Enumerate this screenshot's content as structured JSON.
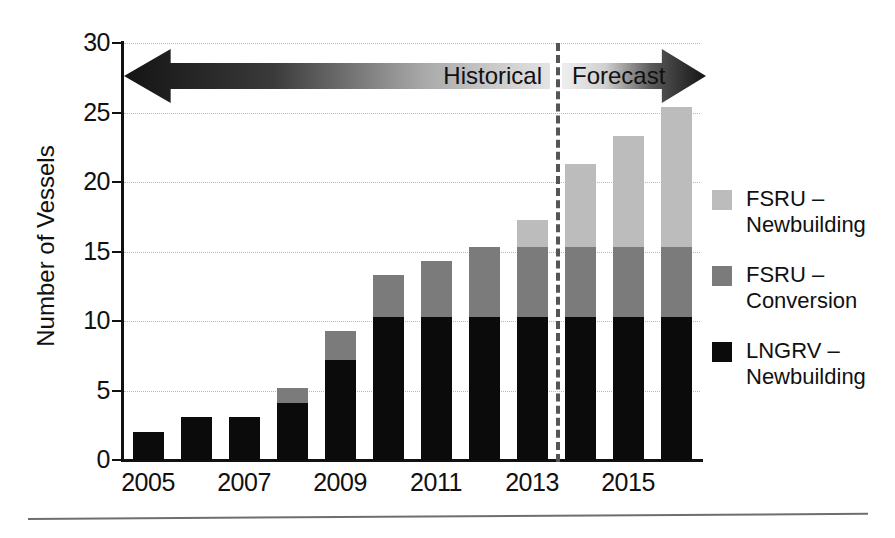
{
  "chart_data": {
    "type": "bar",
    "subtype": "stacked-vertical",
    "title": "",
    "xlabel": "",
    "ylabel": "Number of Vessels",
    "ylim": [
      0,
      30
    ],
    "yticks": [
      0,
      5,
      10,
      15,
      20,
      25,
      30
    ],
    "ytick_labels": [
      "0",
      "5",
      "10",
      "15",
      "20",
      "25",
      "30"
    ],
    "grid": true,
    "grid_axis": "y",
    "grid_style": "dotted",
    "legend_position": "right",
    "categories": [
      2005,
      2006,
      2007,
      2008,
      2009,
      2010,
      2011,
      2012,
      2013,
      2014,
      2015,
      2016
    ],
    "xtick_labels": [
      "2005",
      "2007",
      "2009",
      "2011",
      "2013",
      "2015"
    ],
    "xtick_categories": [
      2005,
      2007,
      2009,
      2011,
      2013,
      2015
    ],
    "series": [
      {
        "name": "LNGRV – Newbuilding",
        "color": "#0b0b0b",
        "values": [
          2.0,
          3.1,
          3.1,
          4.1,
          7.2,
          10.3,
          10.3,
          10.3,
          10.3,
          10.3,
          10.3,
          10.3
        ]
      },
      {
        "name": "FSRU – Conversion",
        "color": "#7b7b7b",
        "values": [
          0.0,
          0.0,
          0.0,
          1.1,
          2.1,
          3.0,
          4.0,
          5.0,
          5.0,
          5.0,
          5.0,
          5.0
        ]
      },
      {
        "name": "FSRU – Newbuilding",
        "color": "#bcbcbc",
        "values": [
          0.0,
          0.0,
          0.0,
          0.0,
          0.0,
          0.0,
          0.0,
          0.0,
          2.0,
          6.0,
          8.0,
          10.1
        ]
      }
    ],
    "totals": [
      2.0,
      3.1,
      3.1,
      5.2,
      9.3,
      13.3,
      14.3,
      15.3,
      17.3,
      21.3,
      23.3,
      25.4
    ],
    "annotations": [
      {
        "name": "historical-arrow",
        "label": "Historical",
        "direction": "left",
        "span": [
          2005,
          2013
        ]
      },
      {
        "name": "forecast-arrow",
        "label": "Forecast",
        "direction": "right",
        "span": [
          2014,
          2016
        ]
      },
      {
        "name": "forecast-divider",
        "label": "",
        "type": "vertical-dashed-line",
        "at": 2013.5
      }
    ]
  },
  "legend": {
    "items": [
      {
        "label": "FSRU –\nNewbuilding",
        "color": "#bcbcbc",
        "name": "fsru-newbuilding"
      },
      {
        "label": "FSRU –\nConversion",
        "color": "#7b7b7b",
        "name": "fsru-conversion"
      },
      {
        "label": "LNGRV –\nNewbuilding",
        "color": "#0b0b0b",
        "name": "lngrv-newbuilding"
      }
    ]
  },
  "axes": {
    "y_title": "Number of Vessels"
  },
  "arrows": {
    "historical": "Historical",
    "forecast": "Forecast"
  },
  "colors": {
    "lngrv_newbuilding": "#0b0b0b",
    "fsru_conversion": "#7b7b7b",
    "fsru_newbuilding": "#bcbcbc",
    "grid": "#b9b9b9",
    "axis": "#111111",
    "divider": "#555555",
    "background": "#ffffff"
  }
}
